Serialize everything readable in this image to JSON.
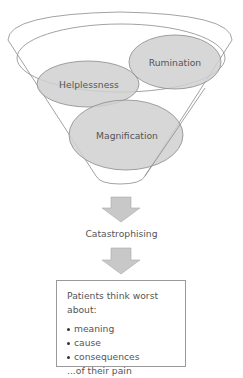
{
  "diagram": {
    "funnel": {
      "ellipses": [
        {
          "label": "Rumination"
        },
        {
          "label": "Helplessness"
        },
        {
          "label": "Magnification"
        }
      ]
    },
    "result": "Catastrophising",
    "outcome_box": {
      "heading": "Patients think worst about:",
      "items": [
        "meaning",
        "cause",
        "consequences"
      ],
      "footer": "...of their pain"
    },
    "colors": {
      "ellipse_fill": "#d0d0d0",
      "ellipse_stroke": "#8a8a8a",
      "funnel_stroke": "#8a8a8a",
      "arrow_fill": "#c8c8c8",
      "text": "#555555"
    }
  }
}
